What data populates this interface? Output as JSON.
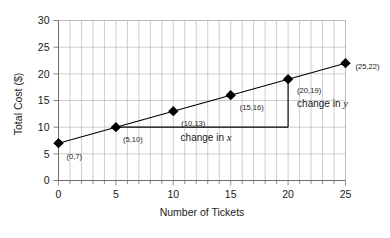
{
  "chart_data": {
    "type": "line",
    "title": "",
    "xlabel": "Number of Tickets",
    "ylabel": "Total Cost ($)",
    "xlim": [
      0,
      25
    ],
    "ylim": [
      0,
      30
    ],
    "x": [
      0,
      5,
      10,
      15,
      20,
      25
    ],
    "values": [
      7,
      10,
      13,
      16,
      19,
      22
    ],
    "series": [
      {
        "name": "Total Cost",
        "values": [
          7,
          10,
          13,
          16,
          19,
          22
        ]
      }
    ],
    "point_labels": [
      "(0,7)",
      "(5,10)",
      "(10,13)",
      "(15,16)",
      "(20,19)",
      "(25,22)"
    ],
    "xticks": [
      0,
      5,
      10,
      15,
      20,
      25
    ],
    "xtick_labels": [
      "0",
      "5",
      "10",
      "15",
      "20",
      "25"
    ],
    "yticks": [
      0,
      5,
      10,
      15,
      20,
      25,
      30
    ],
    "ytick_labels": [
      "0",
      "5",
      "10",
      "15",
      "20",
      "25",
      "30"
    ],
    "x_minor_step": 1,
    "y_major_step": 5,
    "grid": true,
    "legend": "none",
    "marker": "diamond",
    "line_color": "#000000",
    "marker_color": "#000000",
    "grid_color": "#b8b8b8",
    "axis_color": "#8a8a8a",
    "background": "#ffffff",
    "annotations": [
      {
        "name": "change-in-x",
        "text_prefix": "change in ",
        "variable": "x",
        "from": [
          5,
          10
        ],
        "to": [
          20,
          10
        ]
      },
      {
        "name": "change-in-y",
        "text_prefix": "change in ",
        "variable": "y",
        "from": [
          20,
          10
        ],
        "to": [
          20,
          19
        ]
      }
    ]
  },
  "axes": {
    "x_title": "Number of Tickets",
    "y_title": "Total Cost ($)"
  }
}
